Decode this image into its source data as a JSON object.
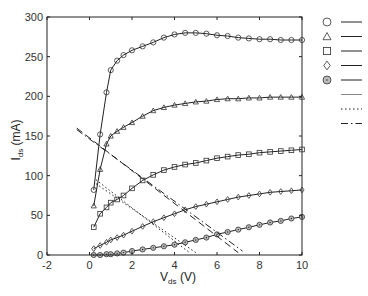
{
  "chart_data": {
    "type": "line",
    "title": "",
    "xlabel": "V_ds (V)",
    "ylabel": "I_ds (mA)",
    "xlim": [
      -2,
      10
    ],
    "ylim": [
      0,
      300
    ],
    "xticks": [
      -2,
      0,
      2,
      4,
      6,
      8,
      10
    ],
    "yticks": [
      0,
      50,
      100,
      150,
      200,
      250,
      300
    ],
    "grid": false,
    "legend_position": "right-outside",
    "series": [
      {
        "name": "circle",
        "marker": "circle",
        "style": "solid",
        "x": [
          0.2,
          0.5,
          0.8,
          1.0,
          1.3,
          1.6,
          2.0,
          2.5,
          3.0,
          3.5,
          4.0,
          4.5,
          5.0,
          5.5,
          6.0,
          6.5,
          7.0,
          7.5,
          8.0,
          8.5,
          9.0,
          9.5,
          10.0
        ],
        "y": [
          82,
          152,
          205,
          233,
          245,
          252,
          258,
          263,
          268,
          274,
          278,
          280,
          280,
          279,
          277,
          276,
          274,
          273,
          272,
          272,
          271,
          271,
          271
        ]
      },
      {
        "name": "triangle",
        "marker": "triangle",
        "style": "solid",
        "x": [
          0.2,
          0.5,
          0.8,
          1.0,
          1.3,
          1.6,
          2.0,
          2.5,
          3.0,
          3.5,
          4.0,
          4.5,
          5.0,
          5.5,
          6.0,
          6.5,
          7.0,
          7.5,
          8.0,
          8.5,
          9.0,
          9.5,
          10.0
        ],
        "y": [
          62,
          108,
          140,
          150,
          156,
          161,
          167,
          175,
          182,
          186,
          189,
          191,
          193,
          194,
          196,
          197,
          197,
          198,
          198,
          199,
          199,
          199,
          199
        ]
      },
      {
        "name": "square",
        "marker": "square",
        "style": "solid",
        "x": [
          0.2,
          0.5,
          0.8,
          1.0,
          1.3,
          1.6,
          2.0,
          2.5,
          3.0,
          3.5,
          4.0,
          4.5,
          5.0,
          5.5,
          6.0,
          6.5,
          7.0,
          7.5,
          8.0,
          8.5,
          9.0,
          9.5,
          10.0
        ],
        "y": [
          35,
          52,
          60,
          66,
          70,
          75,
          84,
          94,
          101,
          107,
          111,
          114,
          116,
          119,
          122,
          124,
          126,
          127,
          129,
          130,
          131,
          132,
          133
        ]
      },
      {
        "name": "diamond",
        "marker": "diamond",
        "style": "solid",
        "x": [
          0.2,
          0.5,
          0.8,
          1.0,
          1.3,
          1.6,
          2.0,
          2.5,
          3.0,
          3.5,
          4.0,
          4.5,
          5.0,
          5.5,
          6.0,
          6.5,
          7.0,
          7.5,
          8.0,
          8.5,
          9.0,
          9.5,
          10.0
        ],
        "y": [
          8,
          12,
          16,
          19,
          22,
          25,
          30,
          36,
          42,
          47,
          52,
          57,
          61,
          64,
          67,
          70,
          73,
          75,
          77,
          79,
          80,
          81,
          82
        ]
      },
      {
        "name": "dotted-circle",
        "marker": "circle-dot",
        "style": "solid",
        "x": [
          0.2,
          0.5,
          0.8,
          1.0,
          1.3,
          1.6,
          2.0,
          2.5,
          3.0,
          3.5,
          4.0,
          4.5,
          5.0,
          5.5,
          6.0,
          6.5,
          7.0,
          7.5,
          8.0,
          8.5,
          9.0,
          9.5,
          10.0
        ],
        "y": [
          0,
          0,
          1,
          1,
          2,
          3,
          5,
          7,
          9,
          11,
          13,
          16,
          19,
          22,
          26,
          29,
          32,
          35,
          38,
          41,
          43,
          46,
          48
        ]
      },
      {
        "name": "load-line-dotted-1",
        "marker": "none",
        "style": "dotted",
        "x": [
          0.3,
          4.7
        ],
        "y": [
          95,
          3
        ]
      },
      {
        "name": "load-line-dotted-2",
        "marker": "none",
        "style": "dotted",
        "x": [
          0.3,
          5.0
        ],
        "y": [
          90,
          3
        ]
      },
      {
        "name": "load-line-dashed-1",
        "marker": "none",
        "style": "dashed",
        "x": [
          -0.6,
          7.0
        ],
        "y": [
          160,
          3
        ]
      },
      {
        "name": "load-line-dashdot",
        "marker": "none",
        "style": "dashdot",
        "x": [
          -0.6,
          7.2
        ],
        "y": [
          158,
          5
        ]
      }
    ]
  },
  "axes": {
    "xlabel_main": "V",
    "xlabel_sub": "ds",
    "xlabel_unit": " (V)",
    "ylabel_main": "I",
    "ylabel_sub": "ds",
    "ylabel_unit": " (mA)"
  },
  "legend": {
    "items": [
      {
        "marker": "circle",
        "line": "solid"
      },
      {
        "marker": "triangle",
        "line": "solid"
      },
      {
        "marker": "square",
        "line": "solid"
      },
      {
        "marker": "diamond",
        "line": "solid"
      },
      {
        "marker": "circle-dot",
        "line": "solid"
      },
      {
        "marker": "none",
        "line": "thin-solid"
      },
      {
        "marker": "none",
        "line": "dotted"
      },
      {
        "marker": "none",
        "line": "dashdot"
      }
    ]
  }
}
